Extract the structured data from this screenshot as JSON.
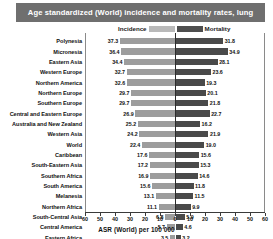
{
  "title": "Age standardized (World) incidence and mortality rates, lung",
  "legend": {
    "incidence_label": "Incidence",
    "mortality_label": "Mortality",
    "incidence_color": "#9d9d9d",
    "mortality_color": "#4a4a4a"
  },
  "axis": {
    "title": "ASR (World) per 100 000",
    "ticks": [
      "60",
      "50",
      "40",
      "30",
      "20",
      "10",
      "0",
      "10",
      "20",
      "30",
      "40",
      "50",
      "60"
    ],
    "max": 60
  },
  "credit": "",
  "chart_data": {
    "type": "bar",
    "title": "Age standardized (World) incidence and mortality rates, lung",
    "subtitle": "",
    "xlabel": "ASR (World) per 100 000",
    "ylabel": "",
    "orientation": "horizontal",
    "layout": "diverging-population-pyramid",
    "grid": false,
    "legend_position": "top-center",
    "xlim": [
      -60,
      60
    ],
    "xticks": [
      60,
      50,
      40,
      30,
      20,
      10,
      0,
      10,
      20,
      30,
      40,
      50,
      60
    ],
    "categories": [
      "Polynesia",
      "Micronesia",
      "Eastern Asia",
      "Western Europe",
      "Northern America",
      "Northern Europe",
      "Southern Europe",
      "Central and Eastern Europe",
      "Australia and New Zealand",
      "Western Asia",
      "World",
      "Caribbean",
      "South-Eastern Asia",
      "Southern Africa",
      "South America",
      "Melanesia",
      "Northern Africa",
      "South-Central Asia",
      "Central America",
      "Eastern Africa",
      "Middle Africa",
      "Western Africa"
    ],
    "series": [
      {
        "name": "Incidence",
        "color": "#9d9d9d",
        "side": "left",
        "values": [
          37.3,
          36.4,
          34.4,
          32.7,
          32.6,
          29.7,
          29.7,
          26.9,
          25.2,
          24.2,
          22.4,
          17.6,
          17.2,
          16.9,
          15.6,
          13.1,
          11.1,
          6.8,
          5.7,
          3.5,
          2.5,
          2.2
        ]
      },
      {
        "name": "Mortality",
        "color": "#4a4a4a",
        "side": "right",
        "values": [
          31.8,
          34.9,
          28.1,
          23.6,
          19.3,
          20.1,
          21.8,
          22.7,
          16.2,
          21.9,
          19.0,
          15.6,
          15.3,
          14.6,
          11.8,
          11.5,
          9.9,
          5.9,
          4.6,
          3.2,
          2.4,
          3.1
        ]
      }
    ]
  }
}
